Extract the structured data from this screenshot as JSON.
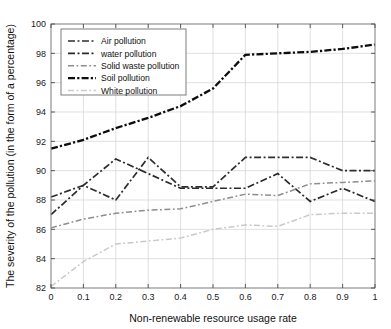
{
  "chart_data": {
    "type": "line",
    "title": "",
    "xlabel": "Non-renewable resource usage rate",
    "ylabel": "The severity of the pollution (in the form of a percentage)",
    "xlim": [
      0,
      1
    ],
    "ylim": [
      82,
      100
    ],
    "xticks": [
      "0",
      "0.1",
      "0.2",
      "0.3",
      "0.4",
      "0.5",
      "0.6",
      "0.7",
      "0.8",
      "0.9",
      "1"
    ],
    "xtick_values": [
      0,
      0.1,
      0.2,
      0.3,
      0.4,
      0.5,
      0.6,
      0.7,
      0.8,
      0.9,
      1
    ],
    "yticks": [
      "82",
      "84",
      "86",
      "88",
      "90",
      "92",
      "94",
      "96",
      "98",
      "100"
    ],
    "ytick_values": [
      82,
      84,
      86,
      88,
      90,
      92,
      94,
      96,
      98,
      100
    ],
    "grid": true,
    "legend_position": "upper left",
    "x": [
      0,
      0.1,
      0.2,
      0.3,
      0.4,
      0.5,
      0.6,
      0.7,
      0.8,
      0.9,
      1
    ],
    "series": [
      {
        "name": "Air pollution",
        "color": "#2e2e2e",
        "width": 1.7,
        "dash": "7,2.5,2,2.5",
        "values": [
          88.2,
          89.0,
          88.0,
          90.9,
          88.9,
          88.9,
          90.9,
          90.9,
          90.9,
          90.0,
          90.0
        ]
      },
      {
        "name": "water pollution",
        "color": "#2a2a2a",
        "width": 1.7,
        "dash": "7,2.5,2,2.5",
        "values": [
          87.0,
          89.0,
          90.8,
          89.8,
          88.8,
          88.8,
          88.8,
          89.8,
          87.9,
          88.8,
          87.9
        ]
      },
      {
        "name": "Solid waste pollution",
        "color": "#8e8e8e",
        "width": 1.5,
        "dash": "6,2.5,1.8,2.5",
        "values": [
          86.1,
          86.7,
          87.1,
          87.3,
          87.4,
          87.9,
          88.4,
          88.3,
          89.1,
          89.2,
          89.3
        ]
      },
      {
        "name": "Soil pollution",
        "color": "#0d0d0d",
        "width": 2.3,
        "dash": "7,2.2,2.2,2.2",
        "values": [
          91.5,
          92.1,
          92.9,
          93.6,
          94.4,
          95.6,
          97.9,
          98.0,
          98.1,
          98.3,
          98.6
        ]
      },
      {
        "name": "White pollution",
        "color": "#c9c9c9",
        "width": 1.5,
        "dash": "6,2.5,1.8,2.5",
        "values": [
          82.1,
          83.8,
          85.0,
          85.2,
          85.4,
          86.0,
          86.3,
          86.2,
          87.0,
          87.1,
          87.1
        ]
      }
    ]
  }
}
